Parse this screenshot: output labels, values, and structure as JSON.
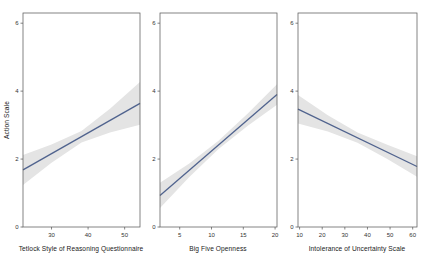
{
  "figure": {
    "background": "#ffffff",
    "width": 424,
    "height": 265
  },
  "chart_data": [
    {
      "type": "line",
      "title": "",
      "xlabel": "Tetlock Style of Reasoning Questionnaire",
      "ylabel": "Action Scale",
      "xlim": [
        22.2,
        54.2
      ],
      "ylim": [
        0,
        6.3
      ],
      "xticks": [
        30,
        40,
        50
      ],
      "yticks": [
        0,
        2,
        4,
        6
      ],
      "grid": false,
      "legend": false,
      "series": [
        {
          "name": "fitted-regression-line",
          "x": [
            22.2,
            54.2
          ],
          "y": [
            1.68,
            3.64
          ]
        }
      ],
      "confidence_band": {
        "x": [
          22.2,
          30,
          38.2,
          46,
          54.2
        ],
        "upper": [
          2.12,
          2.43,
          2.83,
          3.48,
          4.27
        ],
        "lower": [
          1.24,
          1.89,
          2.49,
          2.78,
          3.01
        ]
      },
      "line_color": "#50638e",
      "band_color": "#e4e4e4",
      "border_color": "#5c5c5c",
      "tick_label_color": "#333333"
    },
    {
      "type": "line",
      "title": "",
      "xlabel": "Big Five Openness",
      "ylabel": "",
      "xlim": [
        1.9,
        20.3
      ],
      "ylim": [
        0,
        6.3
      ],
      "xticks": [
        5,
        10,
        15,
        20
      ],
      "yticks": [
        0,
        2,
        4,
        6
      ],
      "grid": false,
      "legend": false,
      "series": [
        {
          "name": "fitted-regression-line",
          "x": [
            1.9,
            20.3
          ],
          "y": [
            0.93,
            3.9
          ]
        }
      ],
      "confidence_band": {
        "x": [
          1.9,
          6.5,
          11.1,
          15.7,
          20.3
        ],
        "upper": [
          1.3,
          1.87,
          2.54,
          3.34,
          4.2
        ],
        "lower": [
          0.56,
          1.47,
          2.3,
          2.98,
          3.6
        ]
      },
      "line_color": "#50638e",
      "band_color": "#e4e4e4",
      "border_color": "#5c5c5c",
      "tick_label_color": "#333333"
    },
    {
      "type": "line",
      "title": "",
      "xlabel": "Intolerance of Uncertainty Scale",
      "ylabel": "",
      "xlim": [
        9.3,
        61.9
      ],
      "ylim": [
        0,
        6.3
      ],
      "xticks": [
        10,
        20,
        30,
        40,
        50,
        60
      ],
      "yticks": [
        0,
        2,
        4,
        6
      ],
      "grid": false,
      "legend": false,
      "series": [
        {
          "name": "fitted-regression-line",
          "x": [
            9.3,
            61.9
          ],
          "y": [
            3.47,
            1.78
          ]
        }
      ],
      "confidence_band": {
        "x": [
          9.3,
          22.45,
          35.6,
          48.75,
          61.9
        ],
        "upper": [
          3.89,
          3.29,
          2.78,
          2.42,
          2.08
        ],
        "lower": [
          3.05,
          2.81,
          2.48,
          2.0,
          1.48
        ]
      },
      "line_color": "#50638e",
      "band_color": "#e4e4e4",
      "border_color": "#5c5c5c",
      "tick_label_color": "#333333"
    }
  ]
}
